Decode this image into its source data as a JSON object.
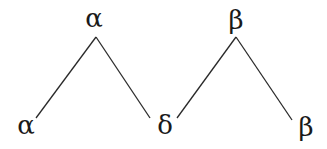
{
  "diagram": {
    "type": "tree",
    "trees": [
      {
        "root": {
          "label": "α",
          "x": 94,
          "y": 27
        },
        "apex": {
          "x": 96,
          "y": 37
        },
        "children": [
          {
            "label": "α",
            "x": 26,
            "y": 134,
            "edge_end": {
              "x": 36,
              "y": 118
            }
          },
          {
            "label": "δ",
            "x": 165,
            "y": 134,
            "edge_end": {
              "x": 150,
              "y": 118
            }
          }
        ]
      },
      {
        "root": {
          "label": "β",
          "x": 236,
          "y": 28
        },
        "apex": {
          "x": 236,
          "y": 37
        },
        "children": [
          {
            "label": "δ",
            "x": 165,
            "y": 134,
            "edge_end": {
              "x": 177,
              "y": 118
            },
            "shared": true
          },
          {
            "label": "β",
            "x": 306,
            "y": 136,
            "edge_end": {
              "x": 292,
              "y": 120
            }
          }
        ]
      }
    ],
    "nodes": {
      "root_left": "α",
      "root_right": "β",
      "leaf_left": "α",
      "leaf_middle": "δ",
      "leaf_right": "β"
    },
    "colors": {
      "line": "#2a2a2a",
      "text": "#1a1a1a",
      "background": "#ffffff"
    }
  }
}
